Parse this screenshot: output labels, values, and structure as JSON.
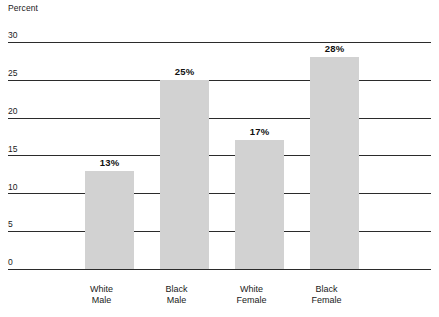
{
  "chart_data": {
    "type": "bar",
    "title": "",
    "subtitle": "",
    "xlabel": "",
    "ylabel": "Percent",
    "ylim": [
      0,
      30
    ],
    "yticks": [
      0,
      5,
      10,
      15,
      20,
      25,
      30
    ],
    "ytick_labels": [
      "0",
      "5",
      "10",
      "15",
      "20",
      "25",
      "30"
    ],
    "grid": "horizontal",
    "legend": "none",
    "categories": [
      "White Male",
      "Black Male",
      "White Female",
      "Black Female"
    ],
    "category_lines": [
      [
        "White",
        "Male"
      ],
      [
        "Black",
        "Male"
      ],
      [
        "White",
        "Female"
      ],
      [
        "Black",
        "Female"
      ]
    ],
    "values": [
      13,
      25,
      17,
      28
    ],
    "value_labels": [
      "13%",
      "25%",
      "17%",
      "28%"
    ],
    "bar_color": "#d2d2d2",
    "gridline_color": "#2b2b2b",
    "text_color": "#1a1a1a"
  }
}
